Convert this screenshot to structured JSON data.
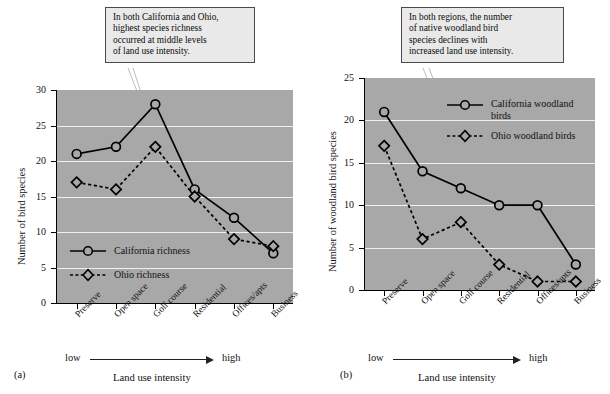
{
  "figure": {
    "panel_a_label": "(a)",
    "panel_b_label": "(b)"
  },
  "callouts": {
    "a": [
      "In both California and Ohio,",
      "highest species richness",
      "occurred at middle levels",
      "of land use intensity."
    ],
    "b": [
      "In both regions, the number",
      "of native woodland bird",
      "species declines with",
      "increased land use intensity."
    ]
  },
  "axis_extra": {
    "low": "low",
    "high": "high"
  },
  "chart_data": [
    {
      "id": "a",
      "type": "line",
      "title": "",
      "xlabel": "Land use intensity",
      "ylabel": "Number of bird species",
      "categories": [
        "Preserve",
        "Open space",
        "Golf course",
        "Residential",
        "Offices/apts",
        "Business"
      ],
      "ylim": [
        0,
        30
      ],
      "yticks": [
        0,
        5,
        10,
        15,
        20,
        25,
        30
      ],
      "grid": true,
      "legend_position": "inside-lower-left",
      "series": [
        {
          "name": "California richness",
          "marker": "circle",
          "linestyle": "solid",
          "values": [
            21,
            22,
            28,
            16,
            12,
            7
          ]
        },
        {
          "name": "Ohio richness",
          "marker": "diamond",
          "linestyle": "dashed",
          "values": [
            17,
            16,
            22,
            15,
            9,
            8
          ]
        }
      ]
    },
    {
      "id": "b",
      "type": "line",
      "title": "",
      "xlabel": "Land use intensity",
      "ylabel": "Number of woodland bird species",
      "categories": [
        "Preserve",
        "Open space",
        "Golf course",
        "Residential",
        "Offices/apts",
        "Business"
      ],
      "ylim": [
        0,
        25
      ],
      "yticks": [
        0,
        5,
        10,
        15,
        20,
        25
      ],
      "grid": true,
      "legend_position": "inside-upper-right",
      "series": [
        {
          "name": "California woodland birds",
          "marker": "circle",
          "linestyle": "solid",
          "values": [
            21,
            14,
            12,
            10,
            10,
            3
          ]
        },
        {
          "name": "Ohio woodland birds",
          "marker": "diamond",
          "linestyle": "dashed",
          "values": [
            17,
            6,
            8,
            3,
            1,
            1
          ]
        }
      ]
    }
  ],
  "legends": {
    "a": [
      {
        "label": "California richness",
        "marker": "circle",
        "linestyle": "solid"
      },
      {
        "label": "Ohio richness",
        "marker": "diamond",
        "linestyle": "dashed"
      }
    ],
    "b": [
      {
        "label": "California woodland birds",
        "marker": "circle",
        "linestyle": "solid"
      },
      {
        "label": "Ohio woodland birds",
        "marker": "diamond",
        "linestyle": "dashed"
      }
    ]
  },
  "colors": {
    "plot_background": "#a8a8a8",
    "gridline": "#f0f0f0",
    "callout_background": "#e9e9e9",
    "callout_border": "#4a4a4a",
    "ink": "#000000",
    "leader": "#bdbdbd"
  }
}
